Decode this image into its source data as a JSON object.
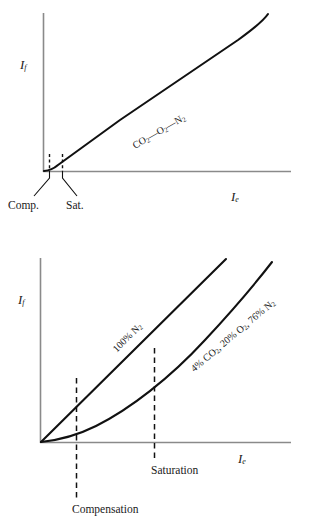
{
  "figure": {
    "background": "#ffffff",
    "ink": "#1a1a1a",
    "axis_color": "#8a8a8a",
    "curve_color": "#111111"
  },
  "charts": [
    {
      "id": "top",
      "type": "line",
      "title": "",
      "xlabel": "I",
      "xlabel_sub": "e",
      "ylabel": "I",
      "ylabel_sub": "f",
      "xlim": [
        0,
        1
      ],
      "ylim": [
        0,
        1
      ],
      "grid": false,
      "legend": "inline-curve-label",
      "series": [
        {
          "name": "CO2-O2-N2",
          "label": "CO",
          "label_sub1": "2",
          "label_mid": "—O",
          "label_sub2": "2",
          "label_end": "—N",
          "label_sub3": "2",
          "label_rotation_deg": -30,
          "x": [
            0.0,
            0.03,
            0.06,
            0.1,
            0.2,
            0.3,
            0.4,
            0.5,
            0.6,
            0.7,
            0.8,
            0.88,
            0.94,
            1.0
          ],
          "y": [
            0.0,
            0.01,
            0.035,
            0.075,
            0.175,
            0.275,
            0.375,
            0.475,
            0.575,
            0.675,
            0.785,
            0.86,
            0.92,
            1.0
          ]
        }
      ],
      "markers": [
        {
          "name": "compensation",
          "label": "Comp.",
          "x": 0.022,
          "y_top": 0.1,
          "style": "dashed-vertical"
        },
        {
          "name": "saturation",
          "label": "Sat.",
          "x": 0.055,
          "y_top": 0.1,
          "style": "dashed-vertical"
        }
      ]
    },
    {
      "id": "bottom",
      "type": "line",
      "title": "",
      "xlabel": "I",
      "xlabel_sub": "e",
      "ylabel": "I",
      "ylabel_sub": "f",
      "xlim": [
        0,
        1
      ],
      "ylim": [
        0,
        1
      ],
      "grid": false,
      "legend": "inline-curve-label",
      "series": [
        {
          "name": "100% N2",
          "label": "100% N",
          "label_sub1": "2",
          "label_rotation_deg": -45,
          "x": [
            0.0,
            0.1,
            0.2,
            0.3,
            0.4,
            0.5,
            0.6,
            0.7,
            0.8
          ],
          "y": [
            0.0,
            0.125,
            0.25,
            0.375,
            0.5,
            0.625,
            0.75,
            0.875,
            1.0
          ]
        },
        {
          "name": "4% CO2, 20% O2, 76% N2",
          "label_a": "4% CO",
          "label_a_sub": "2",
          "label_b": ", 20% O",
          "label_b_sub": "2",
          "label_c": ", 76% N",
          "label_c_sub": "2",
          "label_rotation_deg": -40,
          "x": [
            0.0,
            0.05,
            0.1,
            0.2,
            0.3,
            0.4,
            0.5,
            0.6,
            0.7,
            0.8,
            0.9,
            1.0
          ],
          "y": [
            0.0,
            0.012,
            0.03,
            0.085,
            0.155,
            0.235,
            0.325,
            0.425,
            0.535,
            0.655,
            0.785,
            0.92
          ]
        }
      ],
      "markers": [
        {
          "name": "compensation",
          "label": "Compensation",
          "x": 0.155,
          "style": "dashed-vertical-full"
        },
        {
          "name": "saturation",
          "label": "Saturation",
          "x": 0.5,
          "style": "dashed-vertical-full"
        }
      ]
    }
  ]
}
